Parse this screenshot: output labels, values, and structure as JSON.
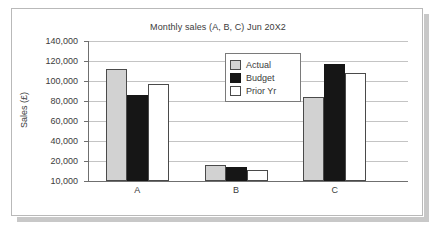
{
  "chart_data": {
    "type": "bar",
    "title": "Monthly sales (A, B, C) Jun 20X2",
    "xlabel": "",
    "ylabel": "Sales (£)",
    "categories": [
      "A",
      "B",
      "C"
    ],
    "series": [
      {
        "name": "Actual",
        "color": "#d2d2d2",
        "values": [
          114000,
          25000,
          88000
        ]
      },
      {
        "name": "Budget",
        "color": "#161616",
        "values": [
          90000,
          23000,
          119000
        ]
      },
      {
        "name": "Prior Yr",
        "color": "#ffffff",
        "values": [
          100000,
          20000,
          110000
        ]
      }
    ],
    "ylim": [
      10000,
      140000
    ],
    "yticks": [
      140000,
      120000,
      100000,
      80000,
      60000,
      40000,
      20000,
      10000
    ],
    "ytick_labels": [
      "140,000",
      "120,000",
      "100,000",
      "80,000",
      "60,000",
      "40,000",
      "20,000",
      "10,000"
    ],
    "grid": true,
    "legend_position": "upper center"
  },
  "panel": {
    "background": "#ffffff",
    "border_color": "#b9b9b9",
    "shadow_color": "#c8c8c8"
  }
}
